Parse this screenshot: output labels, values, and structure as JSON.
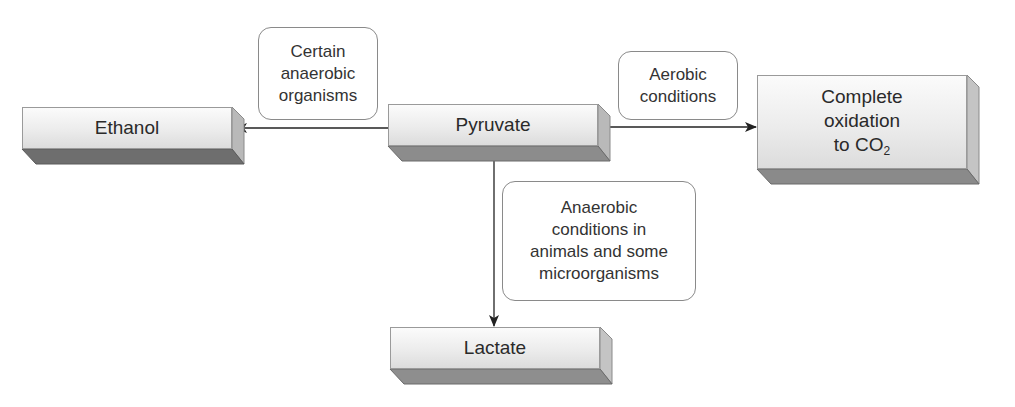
{
  "diagram": {
    "nodes": {
      "ethanol": {
        "label": "Ethanol"
      },
      "pyruvate": {
        "label": "Pyruvate"
      },
      "complete": {
        "line1": "Complete",
        "line2": "oxidation",
        "line3_prefix": "to CO",
        "line3_sub": "2"
      },
      "lactate": {
        "label": "Lactate"
      }
    },
    "edge_labels": {
      "to_ethanol": {
        "line1": "Certain",
        "line2": "anaerobic",
        "line3": "organisms"
      },
      "to_complete": {
        "line1": "Aerobic",
        "line2": "conditions"
      },
      "to_lactate": {
        "line1": "Anaerobic",
        "line2": "conditions in",
        "line3": "animals and some",
        "line4": "microorganisms"
      }
    },
    "edges": [
      {
        "from": "pyruvate",
        "to": "ethanol",
        "label": "Certain anaerobic organisms"
      },
      {
        "from": "pyruvate",
        "to": "complete",
        "label": "Aerobic conditions"
      },
      {
        "from": "pyruvate",
        "to": "lactate",
        "label": "Anaerobic conditions in animals and some microorganisms"
      }
    ]
  }
}
